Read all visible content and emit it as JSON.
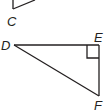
{
  "diagram": {
    "top_triangle": {
      "visible_vertex_label": "C"
    },
    "bottom_triangle": {
      "vertices": [
        {
          "label": "D"
        },
        {
          "label": "E"
        },
        {
          "label": "F"
        }
      ],
      "right_angle_at": "E"
    },
    "colors": {
      "stroke": "#231f20",
      "background": "#ffffff"
    }
  }
}
